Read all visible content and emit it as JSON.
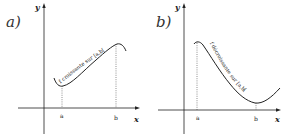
{
  "figure": {
    "panels": [
      {
        "label": "a)",
        "y_axis_label": "y",
        "x_axis_label": "x",
        "tick_a": "a",
        "tick_b": "b",
        "curve_caption": "f croissante sur [a,b[",
        "behavior": "increasing"
      },
      {
        "label": "b)",
        "y_axis_label": "y",
        "x_axis_label": "x",
        "tick_a": "a",
        "tick_b": "b",
        "curve_caption": "f décroissante sur [a,b[",
        "behavior": "decreasing"
      }
    ],
    "colors": {
      "stroke": "#222222",
      "background": "#ffffff"
    }
  }
}
